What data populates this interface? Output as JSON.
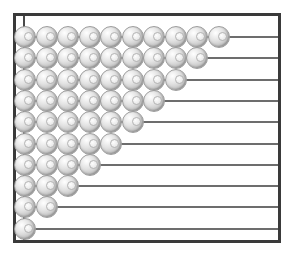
{
  "figure": {
    "kind": "abacus-bead-diagram",
    "background_color": "#ffffff",
    "frame_color": "#3a3a3a",
    "rail_color": "#6d6d6d",
    "post_color": "#4a4a4a",
    "bead_color": "#d8d8d8",
    "bead_outline_color": "#9d9d9d"
  },
  "chart_data": {
    "type": "bar",
    "title": "",
    "subtitle": "",
    "xlabel": "",
    "ylabel": "",
    "orientation": "horizontal",
    "unit": "bead",
    "grid": false,
    "legend": null,
    "xlim": [
      0,
      10
    ],
    "categories": [
      "row-1",
      "row-2",
      "row-3",
      "row-4",
      "row-5",
      "row-6",
      "row-7",
      "row-8",
      "row-9",
      "row-10"
    ],
    "values": [
      10,
      9,
      8,
      7,
      6,
      5,
      4,
      3,
      2,
      1
    ],
    "tick_labels": [],
    "annotations": []
  },
  "rows": [
    {
      "index": 1,
      "beads": 10
    },
    {
      "index": 2,
      "beads": 9
    },
    {
      "index": 3,
      "beads": 8
    },
    {
      "index": 4,
      "beads": 7
    },
    {
      "index": 5,
      "beads": 6
    },
    {
      "index": 6,
      "beads": 5
    },
    {
      "index": 7,
      "beads": 4
    },
    {
      "index": 8,
      "beads": 3
    },
    {
      "index": 9,
      "beads": 2
    },
    {
      "index": 10,
      "beads": 1
    }
  ]
}
